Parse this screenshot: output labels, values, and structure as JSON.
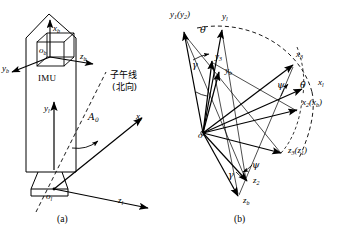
{
  "figure": {
    "panels": [
      {
        "caption": "(a)",
        "description": "rocket body with IMU and launch coordinate frame",
        "labels": {
          "imu": "IMU",
          "meridian_line1": "子午线",
          "meridian_line2": "(北向)",
          "azimuth": "A",
          "azimuth_sub": "0",
          "x_body": "x",
          "x_body_sub": "b",
          "y_body": "y",
          "y_body_sub": "b",
          "z_body": "z",
          "z_body_sub": "b",
          "origin_body": "o",
          "origin_body_sub": "b",
          "x_launch": "x",
          "x_launch_sub": "l",
          "y_launch": "y",
          "y_launch_sub": "l",
          "z_launch": "z",
          "z_launch_sub": "l",
          "origin_launch": "o",
          "origin_launch_sub": "l"
        }
      },
      {
        "caption": "(b)",
        "description": "Euler angle rotation sequence between launch and body frames",
        "labels": {
          "origin": "o",
          "y1y2": "y",
          "y1y2_sub": "1",
          "y1y2_paren": "(y",
          "y1y2_paren_sub": "2",
          "y1y2_paren_close": ")",
          "y_launch": "y",
          "y_launch_sub": "l",
          "y3": "y",
          "y3_sub": "3",
          "y_body": "y",
          "y_body_sub": "b",
          "x3": "x",
          "x3_sub": "3",
          "x_launch": "x",
          "x_launch_sub": "l",
          "x2xb": "x",
          "x2xb_sub": "2",
          "x2xb_paren": "(x",
          "x2xb_paren_sub": "b",
          "x2xb_paren_close": ")",
          "z3z1": "z",
          "z3z1_sub": "3",
          "z3z1_paren": "(z",
          "z3z1_paren_sub": "1",
          "z3z1_paren_close": ")",
          "z2": "z",
          "z2_sub": "2",
          "z_body": "z",
          "z_body_sub": "b",
          "theta_top": "θ",
          "theta_right": "θ",
          "gamma_upper": "γ",
          "gamma_lower": "γ",
          "psi_upper": "ψ",
          "psi_lower": "ψ"
        }
      }
    ],
    "colors": {
      "stroke": "#000000",
      "background": "#ffffff",
      "dashed": "#000000"
    }
  }
}
